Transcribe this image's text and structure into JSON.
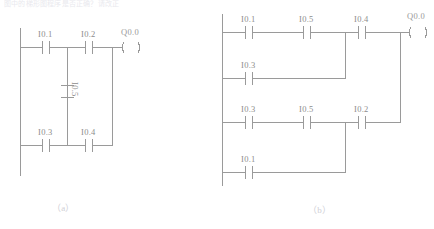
{
  "page": {
    "header_text": "图中的梯形图程序是否正确？请改正",
    "background": "#ffffff",
    "line_color": "#9a9a9a",
    "text_color": "#8d8d8d"
  },
  "diagrams": [
    {
      "id": "a",
      "caption": "（a）",
      "type": "ladder-diagram",
      "rungs": [
        {
          "id": "a-rung-1",
          "contacts": [
            "I0.1",
            "I0.2"
          ],
          "coil": "Q0.0"
        },
        {
          "id": "a-rung-2",
          "contacts": [
            "I0.3",
            "I0.4"
          ],
          "coil": ""
        }
      ],
      "vertical_contacts": [
        {
          "id": "a-bridge-contact",
          "label": "I0.5",
          "orientation": "vertical"
        }
      ]
    },
    {
      "id": "b",
      "caption": "（b）",
      "type": "ladder-diagram",
      "rungs": [
        {
          "id": "b-rung-1",
          "contacts": [
            "I0.1",
            "I0.5",
            "I0.4"
          ],
          "coil": "Q0.0"
        },
        {
          "id": "b-rung-2",
          "contacts": [
            "I0.3"
          ],
          "coil": ""
        },
        {
          "id": "b-rung-3",
          "contacts": [
            "I0.3",
            "I0.5",
            "I0.2"
          ],
          "coil": ""
        },
        {
          "id": "b-rung-4",
          "contacts": [
            "I0.1"
          ],
          "coil": ""
        }
      ],
      "vertical_contacts": []
    }
  ],
  "labels": {
    "a": {
      "r1c1": "I0.1",
      "r1c2": "I0.2",
      "r1coil": "Q0.0",
      "bridge": "I0.5",
      "r2c1": "I0.3",
      "r2c2": "I0.4"
    },
    "b": {
      "r1c1": "I0.1",
      "r1c2": "I0.5",
      "r1c3": "I0.4",
      "r1coil": "Q0.0",
      "r2c1": "I0.3",
      "r3c1": "I0.3",
      "r3c2": "I0.5",
      "r3c3": "I0.2",
      "r4c1": "I0.1"
    }
  }
}
